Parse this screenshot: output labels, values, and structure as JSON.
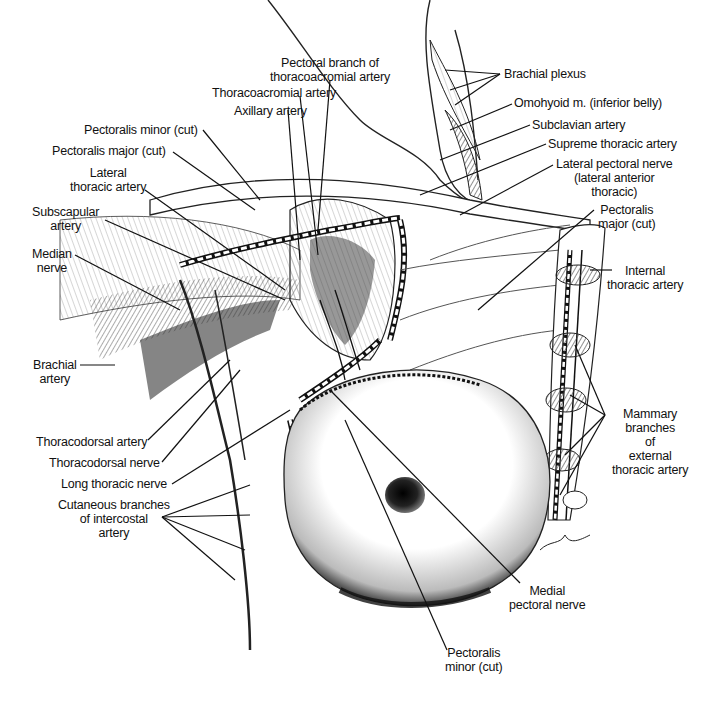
{
  "figure": {
    "signature": "artist signature (lower right)"
  },
  "labels": {
    "pectoral_branch": [
      "Pectoral branch of",
      "thoracoacromial artery"
    ],
    "thoracoacromial": "Thoracoacromial artery",
    "axillary": "Axillary artery",
    "pectoralis_minor_cut_top": "Pectoralis minor (cut)",
    "pectoralis_major_cut_left": "Pectoralis major (cut)",
    "lateral_thoracic": [
      "Lateral",
      "thoracic artery"
    ],
    "subscapular": [
      "Subscapular",
      "artery"
    ],
    "median_nerve": [
      "Median",
      "nerve"
    ],
    "brachial_artery": [
      "Brachial",
      "artery"
    ],
    "thoracodorsal_artery": "Thoracodorsal artery",
    "thoracodorsal_nerve": "Thoracodorsal nerve",
    "long_thoracic_nerve": "Long thoracic nerve",
    "cutaneous_branches": [
      "Cutaneous branches",
      "of intercostal",
      "artery"
    ],
    "brachial_plexus": "Brachial plexus",
    "omohyoid": "Omohyoid m. (inferior belly)",
    "subclavian": "Subclavian artery",
    "supreme_thoracic": "Supreme thoracic artery",
    "lateral_pectoral_nerve": [
      "Lateral pectoral nerve",
      "(lateral anterior",
      "thoracic)"
    ],
    "pectoralis_major_cut_right": [
      "Pectoralis",
      "major (cut)"
    ],
    "internal_thoracic": [
      "Internal",
      "thoracic artery"
    ],
    "mammary_branches": [
      "Mammary",
      "branches",
      "of",
      "external",
      "thoracic artery"
    ],
    "medial_pectoral_nerve": [
      "Medial",
      "pectoral nerve"
    ],
    "pectoralis_minor_cut_bottom": [
      "Pectoralis",
      "minor (cut)"
    ]
  },
  "colors": {
    "ink": "#111111",
    "shade": "#555555",
    "light_shade": "#bbbbbb",
    "paper": "#ffffff"
  }
}
